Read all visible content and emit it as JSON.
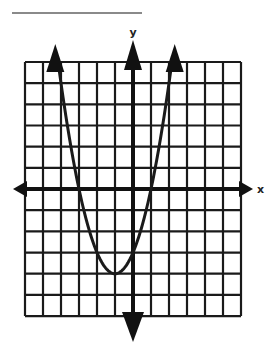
{
  "answer_line": {
    "x1": 12,
    "x2": 142,
    "y": 13,
    "color": "#8a8a8a"
  },
  "graph": {
    "x_axis_label": "x",
    "y_axis_label": "y",
    "grid": {
      "left": 25,
      "top": 62,
      "cols": 12,
      "rows": 12,
      "cell_w": 18,
      "cell_h": 21.17,
      "origin_col": 6,
      "origin_row": 6,
      "line_color": "#1a1a1a"
    },
    "function": {
      "expression": "y = (x + 1)^2 - 4",
      "vertex": [
        -1,
        -4
      ],
      "roots": [
        -3,
        1
      ],
      "x_range": [
        -4.15,
        2.15
      ],
      "color": "#1a1a1a"
    }
  },
  "chart_data": {
    "type": "line",
    "title": "",
    "xlabel": "x",
    "ylabel": "y",
    "xlim": [
      -6,
      6
    ],
    "ylim": [
      -6,
      6
    ],
    "grid": true,
    "series": [
      {
        "name": "parabola",
        "expression": "y = x^2 + 2x - 3",
        "x": [
          -4,
          -3,
          -2,
          -1,
          0,
          1,
          2
        ],
        "y": [
          5,
          0,
          -3,
          -4,
          -3,
          0,
          5
        ]
      }
    ],
    "annotations": [
      "arrowheads on both ends of parabola",
      "arrowheads on axes"
    ]
  }
}
